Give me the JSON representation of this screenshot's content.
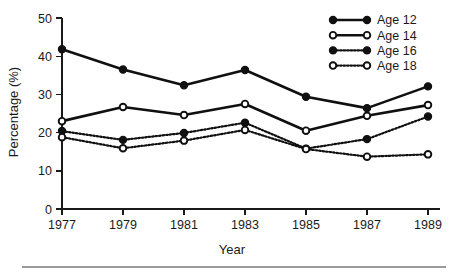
{
  "chart_data": {
    "type": "line",
    "title": "",
    "xlabel": "Year",
    "ylabel": "Percentage (%)",
    "categories": [
      1977,
      1979,
      1981,
      1983,
      1985,
      1987,
      1989
    ],
    "x_tick_labels": [
      "1977",
      "1979",
      "1981",
      "1983",
      "1985",
      "1987",
      "1989"
    ],
    "y_tick_labels": [
      "0",
      "10",
      "20",
      "30",
      "40",
      "50"
    ],
    "y_ticks": [
      0,
      10,
      20,
      30,
      40,
      50
    ],
    "ylim": [
      0,
      50
    ],
    "xlim": [
      1977,
      1989
    ],
    "grid": false,
    "legend_position": "top-right",
    "series": [
      {
        "name": "Age 12",
        "marker": "filled-circle",
        "line_style": "solid",
        "color": "#101010",
        "values": [
          41.8,
          36.5,
          32.4,
          36.4,
          29.4,
          26.4,
          32.1
        ]
      },
      {
        "name": "Age 14",
        "marker": "open-circle",
        "line_style": "solid",
        "color": "#101010",
        "values": [
          23.0,
          26.7,
          24.6,
          27.5,
          20.5,
          24.4,
          27.2
        ]
      },
      {
        "name": "Age 16",
        "marker": "filled-circle",
        "line_style": "dotted",
        "color": "#101010",
        "values": [
          20.4,
          18.1,
          19.9,
          22.6,
          15.8,
          18.3,
          24.2
        ]
      },
      {
        "name": "Age 18",
        "marker": "open-circle",
        "line_style": "dotted",
        "color": "#101010",
        "values": [
          18.8,
          15.9,
          17.9,
          20.7,
          15.7,
          13.7,
          14.3
        ]
      }
    ]
  },
  "legend": {
    "items": [
      {
        "label": "Age 12"
      },
      {
        "label": "Age 14"
      },
      {
        "label": "Age 16"
      },
      {
        "label": "Age 18"
      }
    ]
  },
  "colors": {
    "ink": "#101010",
    "axis": "#1a1a1a",
    "rule": "#9a9a9a",
    "background": "#ffffff"
  }
}
